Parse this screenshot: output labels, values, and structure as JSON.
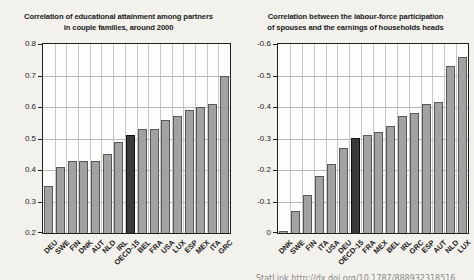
{
  "page": {
    "background": "#f2f1ec",
    "footer": {
      "statlink": "StatLink  http://dx.doi.org/10.1787/888932318516"
    }
  },
  "colors": {
    "bar_fill": "#a2a2a2",
    "bar_border": "#58585a",
    "highlight_fill": "#3a3a3a",
    "highlight_border": "#111111",
    "grid_h": "#b9b9b9",
    "grid_v": "#c7c7c7",
    "frame": "#1f1f1f",
    "plot_background": "#fdfdfb"
  },
  "chart_data": [
    {
      "type": "bar",
      "title": "Correlation of educational attainment among partners in couple families, around 2000",
      "title_lines": [
        "Correlation of educational attainment among partners",
        "in couple families, around 2000"
      ],
      "categories": [
        "DEU",
        "SWE",
        "FIN",
        "DNK",
        "AUT",
        "NLD",
        "IRL",
        "OECD-15",
        "BEL",
        "FRA",
        "USA",
        "LUX",
        "ESP",
        "MEX",
        "ITA",
        "GRC"
      ],
      "values": [
        0.35,
        0.41,
        0.43,
        0.43,
        0.43,
        0.45,
        0.49,
        0.51,
        0.53,
        0.53,
        0.56,
        0.57,
        0.59,
        0.6,
        0.61,
        0.7
      ],
      "highlight_index": 7,
      "highlight_category": "OECD-15",
      "xlabel": "",
      "ylabel": "",
      "ylim": [
        0.2,
        0.8
      ],
      "yticks": [
        0.8,
        0.7,
        0.6,
        0.5,
        0.4,
        0.3,
        0.2
      ],
      "ytick_labels": [
        "0.8",
        "0.7",
        "0.6",
        "0.5",
        "0.4",
        "0.3",
        "0.2"
      ],
      "grid": true,
      "legend": false
    },
    {
      "type": "bar",
      "title": "Correlation between the labour-force participation of spouses and the earnings of households heads",
      "title_lines": [
        "Correlation between the labour-force participation",
        "of spouses and the earnings of households heads"
      ],
      "categories": [
        "DNK",
        "SWE",
        "FIN",
        "ITA",
        "USA",
        "DEU",
        "OECD-15",
        "FRA",
        "MEX",
        "BEL",
        "IRL",
        "GRC",
        "ESP",
        "AUT",
        "NLD",
        "LUX"
      ],
      "values": [
        -0.005,
        -0.07,
        -0.12,
        -0.18,
        -0.22,
        -0.27,
        -0.3,
        -0.31,
        -0.32,
        -0.34,
        -0.37,
        -0.38,
        -0.41,
        -0.415,
        -0.53,
        -0.56
      ],
      "highlight_index": 6,
      "highlight_category": "OECD-15",
      "xlabel": "",
      "ylabel": "",
      "ylim": [
        0,
        -0.6
      ],
      "yticks": [
        -0.6,
        -0.5,
        -0.4,
        -0.3,
        -0.2,
        -0.1,
        0
      ],
      "ytick_labels": [
        "-0.6",
        "-0.5",
        "-0.4",
        "-0.3",
        "-0.2",
        "-0.1",
        "0"
      ],
      "axis_inverted": true,
      "grid": true,
      "legend": false
    }
  ]
}
